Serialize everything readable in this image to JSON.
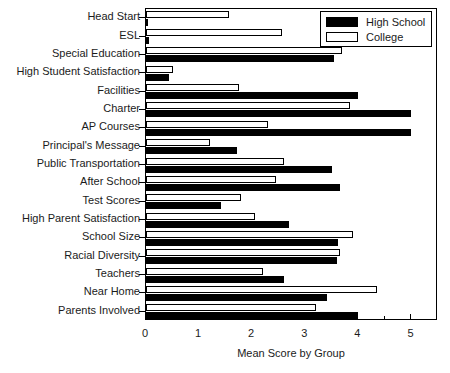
{
  "chart_data": {
    "type": "bar",
    "orientation": "horizontal",
    "title": "",
    "xlabel": "Mean Score by Group",
    "ylabel": "",
    "xlim": [
      0,
      5.5
    ],
    "xticks": [
      0,
      1,
      2,
      3,
      4,
      5
    ],
    "xtick_labels": [
      "0",
      "1",
      "2",
      "3",
      "4",
      "5"
    ],
    "grid": false,
    "legend_position": "top-right",
    "categories": [
      "Head Start",
      "ESL",
      "Special Education",
      "High Student Satisfaction",
      "Facilities",
      "Charter",
      "AP Courses",
      "Principal's Message",
      "Public Transportation",
      "After School",
      "Test Scores",
      "High Parent Satisfaction",
      "School Size",
      "Racial Diversity",
      "Teachers",
      "Near Home",
      "Parents Involved"
    ],
    "series": [
      {
        "name": "High School",
        "color": "#000000",
        "values": [
          0.02,
          0.05,
          3.55,
          0.43,
          4.0,
          5.0,
          5.0,
          1.72,
          3.5,
          3.65,
          1.42,
          2.7,
          3.62,
          3.6,
          2.6,
          3.4,
          4.0
        ]
      },
      {
        "name": "College",
        "color": "#ffffff",
        "values": [
          1.57,
          2.57,
          3.7,
          0.5,
          1.75,
          3.85,
          2.3,
          1.2,
          2.6,
          2.45,
          1.78,
          2.05,
          3.9,
          3.65,
          2.2,
          4.36,
          3.2
        ]
      }
    ]
  },
  "legend": {
    "entries": [
      {
        "label": "High School",
        "swatch": "filled-black"
      },
      {
        "label": "College",
        "swatch": "outlined-white"
      }
    ]
  },
  "axis": {
    "x_title": "Mean Score by Group"
  }
}
